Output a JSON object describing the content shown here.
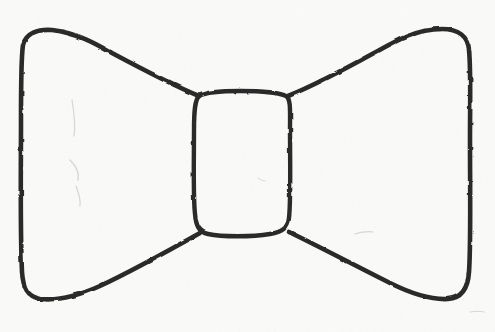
{
  "image": {
    "title": "Hand-drawn bow tie sketch",
    "subject": "bow-tie",
    "medium": "pencil on paper",
    "width": 495,
    "height": 332,
    "style": "line drawing, single continuous outline, no fill"
  },
  "colors": {
    "paper": "#fafaf9",
    "paper_edge": "#f4f3f1",
    "ink": "#2b2a29",
    "ink_soft": "#55524f",
    "smudge": "#b9b4ae"
  },
  "strokes": {
    "outline_width": 4.6,
    "knot_width": 4.4,
    "smudge_width": 1.2
  },
  "shapes": {
    "left_wing": {
      "name": "left-wing",
      "description": "Large left triangle-like wing with rounded outer corners, tapering in to the knot",
      "path": "M 199 96 C 170 84 140 68 112 53 C 98 45 78 33 52 30 C 38 29 26 33 23 45 C 21 58 21 80 21 120 C 21 170 20 230 22 272 C 23 287 27 297 41 299 C 60 301 80 295 100 286 C 130 272 168 251 200 233"
    },
    "right_wing": {
      "name": "right-wing",
      "description": "Large right triangle-like wing mirroring the left, rounded outer corners",
      "path": "M 288 96 C 315 85 345 69 374 53 C 392 43 415 29 442 29 C 458 29 468 36 469 50 C 471 70 470 100 470 140 C 470 190 471 245 469 272 C 468 288 462 298 448 299 C 430 300 410 293 390 283 C 358 267 318 246 289 232"
    },
    "knot": {
      "name": "center-knot",
      "description": "Rounded rectangle knot at the center of the bow",
      "path": "M 199 96 C 206 92 220 91 240 91 C 262 91 278 92 286 96 C 291 99 290 110 290 130 C 290 160 291 200 289 218 C 288 228 282 232 270 234 C 252 237 222 237 208 234 C 199 232 196 226 195 214 C 193 196 194 160 194 130 C 194 110 195 100 199 96 Z"
    }
  },
  "marks": [
    {
      "name": "paper-smudge-upper-left",
      "path": "M 72 100 C 74 112 76 124 74 136"
    },
    {
      "name": "paper-smudge-mid-left",
      "path": "M 70 160 C 76 166 80 172 78 180"
    },
    {
      "name": "paper-smudge-lower-left",
      "path": "M 76 186 C 79 194 81 200 80 206"
    },
    {
      "name": "paper-smudge-right",
      "path": "M 355 234 C 362 232 368 231 373 232"
    },
    {
      "name": "paper-smudge-knot-interior",
      "path": "M 258 178 C 261 180 263 181 265 181"
    },
    {
      "name": "paper-smudge-bottom-right",
      "path": "M 470 312 C 476 311 480 311 484 312"
    }
  ]
}
